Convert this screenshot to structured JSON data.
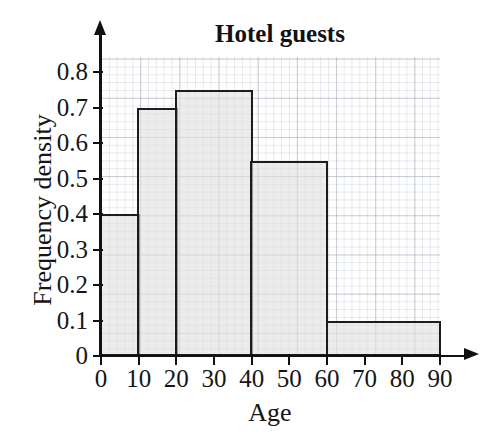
{
  "chart_data": {
    "type": "bar",
    "title": "Hotel guests",
    "xlabel": "Age",
    "ylabel": "Frequency density",
    "subtitle": "",
    "grid": true,
    "legend": false,
    "legend_position": "none",
    "xlim": [
      0,
      90
    ],
    "ylim": [
      0,
      0.8
    ],
    "x_tick_labels": [
      "0",
      "10",
      "20",
      "30",
      "40",
      "50",
      "60",
      "70",
      "80",
      "90"
    ],
    "x_tick_values": [
      0,
      10,
      20,
      30,
      40,
      50,
      60,
      70,
      80,
      90
    ],
    "y_tick_labels": [
      "0",
      "0.1",
      "0.2",
      "0.3",
      "0.4",
      "0.5",
      "0.6",
      "0.7",
      "0.8"
    ],
    "y_tick_values": [
      0,
      0.1,
      0.2,
      0.3,
      0.4,
      0.5,
      0.6,
      0.7,
      0.8
    ],
    "categories": [
      "0-10",
      "10-20",
      "20-40",
      "40-60",
      "60-90"
    ],
    "bins": [
      {
        "label": "0-10",
        "start": 0,
        "end": 10,
        "value": 0.4
      },
      {
        "label": "10-20",
        "start": 10,
        "end": 20,
        "value": 0.7
      },
      {
        "label": "20-40",
        "start": 20,
        "end": 40,
        "value": 0.75
      },
      {
        "label": "40-60",
        "start": 40,
        "end": 60,
        "value": 0.55
      },
      {
        "label": "60-90",
        "start": 60,
        "end": 90,
        "value": 0.1
      }
    ],
    "values": [
      0.4,
      0.7,
      0.75,
      0.55,
      0.1
    ],
    "colors": {
      "bar_fill": "#e1e1e1",
      "bar_stroke": "#1c1c1c",
      "axis": "#111111",
      "grid_major": "#96a0aa",
      "grid_minor": "#afb9c3",
      "text": "#161616",
      "background": "#ffffff"
    }
  }
}
